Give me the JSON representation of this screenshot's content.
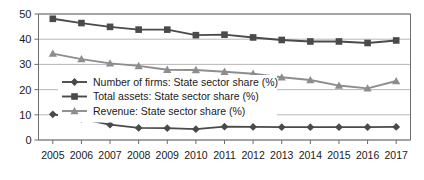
{
  "chart_data": {
    "type": "line",
    "title": "",
    "subtitle": "",
    "xlabel": "",
    "ylabel": "",
    "x": [
      2005,
      2006,
      2007,
      2008,
      2009,
      2010,
      2011,
      2012,
      2013,
      2014,
      2015,
      2016,
      2017
    ],
    "categories": [
      "2005",
      "2006",
      "2007",
      "2008",
      "2009",
      "2010",
      "2011",
      "2012",
      "2013",
      "2014",
      "2015",
      "2016",
      "2017"
    ],
    "ylim": [
      0,
      50
    ],
    "yticks": [
      0,
      10,
      20,
      30,
      40,
      50
    ],
    "ytick_labels": [
      "0",
      "10",
      "20",
      "30",
      "40",
      "50"
    ],
    "grid": true,
    "grid_axis": "y",
    "legend_position": "center-left-inside",
    "series": [
      {
        "name": "Number of firms: State sector share (%)",
        "marker": "diamond",
        "color": "#4a4a4a",
        "values": [
          10.2,
          8.3,
          6.1,
          4.8,
          4.7,
          4.3,
          5.3,
          5.2,
          5.1,
          5.1,
          5.1,
          5.1,
          5.2
        ]
      },
      {
        "name": "Total assets: State sector share (%)",
        "marker": "square",
        "color": "#4a4a4a",
        "values": [
          48.1,
          46.4,
          44.9,
          43.8,
          43.8,
          41.6,
          41.8,
          40.7,
          39.7,
          39.1,
          39.1,
          38.5,
          39.5
        ]
      },
      {
        "name": "Revenue: State sector share (%)",
        "marker": "triangle",
        "color": "#8d8d8d",
        "values": [
          34.3,
          32.1,
          30.4,
          29.4,
          27.9,
          27.8,
          27.1,
          26.3,
          24.9,
          23.8,
          21.6,
          20.5,
          23.4
        ]
      }
    ]
  },
  "legend": {
    "items": [
      {
        "label": "Number of firms: State sector share (%)"
      },
      {
        "label": "Total assets: State sector share (%)"
      },
      {
        "label": "Revenue: State sector share (%)"
      }
    ]
  },
  "colors": {
    "dark_series": "#4a4a4a",
    "light_series": "#8d8d8d",
    "grid": "#9a9a9a",
    "axis": "#6d6d6d",
    "text": "#1a1a1a",
    "background": "#ffffff"
  }
}
